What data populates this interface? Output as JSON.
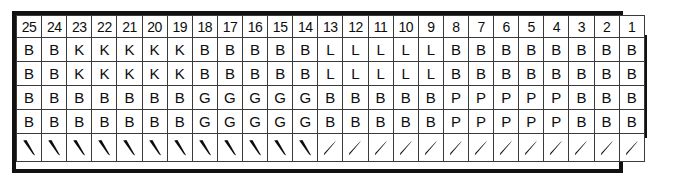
{
  "diagram": {
    "stroke_color": "#111111",
    "cell_border_color": "#3a3a3a",
    "text_color": "#0d0d0d",
    "background": "#ffffff",
    "column_count": 25,
    "header": {
      "name": "column-number-header",
      "labels": [
        "25",
        "24",
        "23",
        "22",
        "21",
        "20",
        "19",
        "18",
        "17",
        "16",
        "15",
        "14",
        "13",
        "12",
        "11",
        "10",
        "9",
        "8",
        "7",
        "6",
        "5",
        "4",
        "3",
        "2",
        "1"
      ]
    },
    "rows": [
      {
        "label": "A",
        "cells": [
          "B",
          "B",
          "K",
          "K",
          "K",
          "K",
          "K",
          "B",
          "B",
          "B",
          "B",
          "B",
          "L",
          "L",
          "L",
          "L",
          "L",
          "B",
          "B",
          "B",
          "B",
          "B",
          "B",
          "B",
          "B"
        ]
      },
      {
        "label": "B",
        "cells": [
          "B",
          "B",
          "K",
          "K",
          "K",
          "K",
          "K",
          "B",
          "B",
          "B",
          "B",
          "B",
          "L",
          "L",
          "L",
          "L",
          "L",
          "B",
          "B",
          "B",
          "B",
          "B",
          "B",
          "B",
          "B"
        ]
      },
      {
        "label": "C",
        "cells": [
          "B",
          "B",
          "B",
          "B",
          "B",
          "B",
          "B",
          "G",
          "G",
          "G",
          "G",
          "G",
          "B",
          "B",
          "B",
          "B",
          "B",
          "P",
          "P",
          "P",
          "P",
          "P",
          "B",
          "B",
          "B"
        ]
      },
      {
        "label": "D",
        "cells": [
          "B",
          "B",
          "B",
          "B",
          "B",
          "B",
          "B",
          "G",
          "G",
          "G",
          "G",
          "G",
          "B",
          "B",
          "B",
          "B",
          "B",
          "P",
          "P",
          "P",
          "P",
          "P",
          "B",
          "B",
          "B"
        ]
      }
    ],
    "arrow_row": {
      "name": "stroke-direction-row",
      "directions": [
        "down-right",
        "down-right",
        "down-right",
        "down-right",
        "down-right",
        "down-right",
        "down-right",
        "down-right",
        "down-right",
        "down-right",
        "down-right",
        "down-right",
        "up-right",
        "up-right",
        "up-right",
        "up-right",
        "up-right",
        "up-right",
        "up-right",
        "up-right",
        "up-right",
        "up-right",
        "up-right",
        "up-right",
        "up-right"
      ]
    }
  }
}
